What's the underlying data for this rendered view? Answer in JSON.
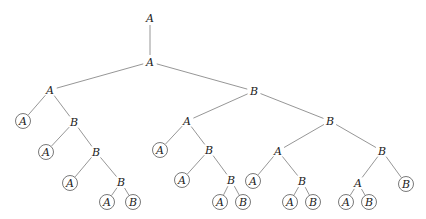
{
  "nodes": [
    {
      "id": "n0",
      "label": "A",
      "x": 150,
      "y": 18,
      "leaf": false
    },
    {
      "id": "n1",
      "label": "A",
      "x": 150,
      "y": 62,
      "leaf": false
    },
    {
      "id": "n2",
      "label": "A",
      "x": 50,
      "y": 90,
      "leaf": false
    },
    {
      "id": "n3",
      "label": "B",
      "x": 254,
      "y": 91,
      "leaf": false
    },
    {
      "id": "n4",
      "label": "A",
      "x": 23,
      "y": 121,
      "leaf": true
    },
    {
      "id": "n5",
      "label": "B",
      "x": 74,
      "y": 122,
      "leaf": false
    },
    {
      "id": "n6",
      "label": "A",
      "x": 46,
      "y": 152,
      "leaf": true
    },
    {
      "id": "n7",
      "label": "B",
      "x": 96,
      "y": 152,
      "leaf": false
    },
    {
      "id": "n8",
      "label": "A",
      "x": 70,
      "y": 183,
      "leaf": true
    },
    {
      "id": "n9",
      "label": "B",
      "x": 121,
      "y": 182,
      "leaf": false
    },
    {
      "id": "n10",
      "label": "A",
      "x": 107,
      "y": 202,
      "leaf": true
    },
    {
      "id": "n11",
      "label": "B",
      "x": 133,
      "y": 202,
      "leaf": true
    },
    {
      "id": "n12",
      "label": "A",
      "x": 187,
      "y": 121,
      "leaf": false
    },
    {
      "id": "n13",
      "label": "B",
      "x": 330,
      "y": 121,
      "leaf": false
    },
    {
      "id": "n14",
      "label": "A",
      "x": 160,
      "y": 150,
      "leaf": true
    },
    {
      "id": "n15",
      "label": "B",
      "x": 209,
      "y": 150,
      "leaf": false
    },
    {
      "id": "n16",
      "label": "A",
      "x": 182,
      "y": 180,
      "leaf": true
    },
    {
      "id": "n17",
      "label": "B",
      "x": 231,
      "y": 180,
      "leaf": false
    },
    {
      "id": "n18",
      "label": "A",
      "x": 220,
      "y": 202,
      "leaf": true
    },
    {
      "id": "n19",
      "label": "B",
      "x": 243,
      "y": 202,
      "leaf": true
    },
    {
      "id": "n20",
      "label": "A",
      "x": 278,
      "y": 151,
      "leaf": false
    },
    {
      "id": "n21",
      "label": "B",
      "x": 382,
      "y": 151,
      "leaf": false
    },
    {
      "id": "n22",
      "label": "A",
      "x": 253,
      "y": 181,
      "leaf": true
    },
    {
      "id": "n23",
      "label": "B",
      "x": 302,
      "y": 181,
      "leaf": false
    },
    {
      "id": "n24",
      "label": "A",
      "x": 290,
      "y": 202,
      "leaf": true
    },
    {
      "id": "n25",
      "label": "B",
      "x": 313,
      "y": 202,
      "leaf": true
    },
    {
      "id": "n26",
      "label": "A",
      "x": 358,
      "y": 183,
      "leaf": false
    },
    {
      "id": "n27",
      "label": "B",
      "x": 406,
      "y": 184,
      "leaf": true
    },
    {
      "id": "n28",
      "label": "A",
      "x": 346,
      "y": 202,
      "leaf": true
    },
    {
      "id": "n29",
      "label": "B",
      "x": 369,
      "y": 202,
      "leaf": true
    }
  ],
  "edges": [
    [
      "n0",
      "n1"
    ],
    [
      "n1",
      "n2"
    ],
    [
      "n1",
      "n3"
    ],
    [
      "n2",
      "n4"
    ],
    [
      "n2",
      "n5"
    ],
    [
      "n5",
      "n6"
    ],
    [
      "n5",
      "n7"
    ],
    [
      "n7",
      "n8"
    ],
    [
      "n7",
      "n9"
    ],
    [
      "n9",
      "n10"
    ],
    [
      "n9",
      "n11"
    ],
    [
      "n3",
      "n12"
    ],
    [
      "n3",
      "n13"
    ],
    [
      "n12",
      "n14"
    ],
    [
      "n12",
      "n15"
    ],
    [
      "n15",
      "n16"
    ],
    [
      "n15",
      "n17"
    ],
    [
      "n17",
      "n18"
    ],
    [
      "n17",
      "n19"
    ],
    [
      "n13",
      "n20"
    ],
    [
      "n13",
      "n21"
    ],
    [
      "n20",
      "n22"
    ],
    [
      "n20",
      "n23"
    ],
    [
      "n23",
      "n24"
    ],
    [
      "n23",
      "n25"
    ],
    [
      "n21",
      "n26"
    ],
    [
      "n21",
      "n27"
    ],
    [
      "n26",
      "n28"
    ],
    [
      "n26",
      "n29"
    ]
  ]
}
